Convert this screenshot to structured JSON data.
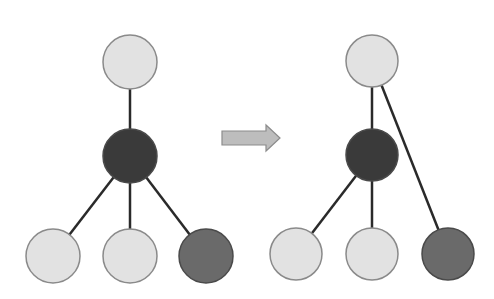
{
  "diagram": {
    "type": "tree-transformation",
    "colors": {
      "light_node": "#e2e2e2",
      "dark_node": "#3a3a3a",
      "medium_node": "#6a6a6a",
      "node_stroke": "#8a8a8a",
      "edge": "#2a2a2a",
      "arrow_fill": "#bdbdbd",
      "arrow_stroke": "#8c8c8c"
    },
    "before_tree": {
      "nodes": [
        {
          "id": "root",
          "cx": 130,
          "cy": 62,
          "r": 27,
          "shade": "light"
        },
        {
          "id": "middle",
          "cx": 130,
          "cy": 156,
          "r": 27,
          "shade": "dark"
        },
        {
          "id": "leaf-left",
          "cx": 53,
          "cy": 256,
          "r": 27,
          "shade": "light"
        },
        {
          "id": "leaf-center",
          "cx": 130,
          "cy": 256,
          "r": 27,
          "shade": "light"
        },
        {
          "id": "leaf-right",
          "cx": 206,
          "cy": 256,
          "r": 27,
          "shade": "medium"
        }
      ],
      "edges": [
        [
          "root",
          "middle"
        ],
        [
          "middle",
          "leaf-left"
        ],
        [
          "middle",
          "leaf-center"
        ],
        [
          "middle",
          "leaf-right"
        ]
      ]
    },
    "arrow": {
      "x1": 222,
      "x2": 280,
      "cy": 138,
      "direction": "right"
    },
    "after_tree": {
      "nodes": [
        {
          "id": "root",
          "cx": 372,
          "cy": 61,
          "r": 26,
          "shade": "light"
        },
        {
          "id": "middle",
          "cx": 372,
          "cy": 155,
          "r": 26,
          "shade": "dark"
        },
        {
          "id": "leaf-left",
          "cx": 296,
          "cy": 254,
          "r": 26,
          "shade": "light"
        },
        {
          "id": "leaf-center",
          "cx": 372,
          "cy": 254,
          "r": 26,
          "shade": "light"
        },
        {
          "id": "leaf-right",
          "cx": 448,
          "cy": 254,
          "r": 26,
          "shade": "medium"
        }
      ],
      "edges": [
        [
          "root",
          "middle"
        ],
        [
          "root",
          "leaf-right"
        ],
        [
          "middle",
          "leaf-left"
        ],
        [
          "middle",
          "leaf-center"
        ]
      ]
    }
  }
}
